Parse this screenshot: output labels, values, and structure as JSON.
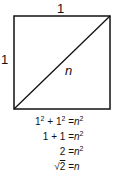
{
  "diagram": {
    "top_label": "1",
    "left_label": "1",
    "diagonal_label": "n",
    "equations": [
      {
        "lhs": "1² + 1²",
        "rhs": "n²"
      },
      {
        "lhs": "1 + 1",
        "rhs": "n²"
      },
      {
        "lhs": "2",
        "rhs": "n²"
      },
      {
        "lhs": "√2",
        "rhs": "n"
      }
    ],
    "equals": "="
  }
}
